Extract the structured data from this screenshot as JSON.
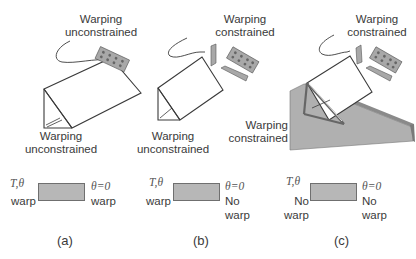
{
  "panels": [
    {
      "id": "a",
      "top_label": "Warping\nunconstrained",
      "top_label_lines": [
        "Warping",
        "unconstrained"
      ],
      "bottom_label_lines": [
        "Warping",
        "unconstrained"
      ],
      "left_symbol": "T,θ",
      "left_text_lines": [
        "warp"
      ],
      "right_symbol": "θ=0",
      "right_text_lines": [
        "warp"
      ],
      "caption": "(a)"
    },
    {
      "id": "b",
      "top_label_lines": [
        "Warping",
        "constrained"
      ],
      "bottom_label_lines": [
        "Warping",
        "unconstrained"
      ],
      "left_symbol": "T,θ",
      "left_text_lines": [
        "warp"
      ],
      "right_symbol": "θ=0",
      "right_text_lines": [
        "No",
        "warp"
      ],
      "caption": "(b)"
    },
    {
      "id": "c",
      "top_label_lines": [
        "Warping",
        "constrained"
      ],
      "bottom_label_lines": [
        "Warping",
        "constrained"
      ],
      "left_symbol": "T,θ",
      "left_text_lines": [
        "No",
        "warp"
      ],
      "right_symbol": "θ=0",
      "right_text_lines": [
        "No",
        "warp"
      ],
      "caption": "(c)"
    }
  ],
  "colors": {
    "line": "#3a3a3a",
    "plate_fill": "#b0b0b0",
    "element_fill": "#b7b7b7",
    "text": "#3a3a3a"
  }
}
